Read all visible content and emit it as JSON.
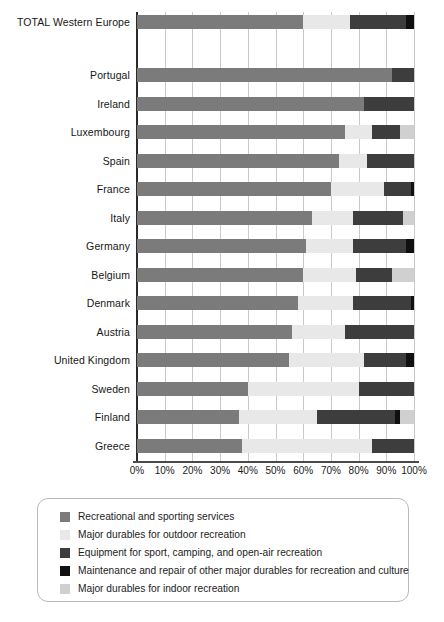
{
  "chart_data": {
    "type": "bar",
    "orientation": "horizontal",
    "stacked": true,
    "title": "",
    "subtitle": "",
    "xlabel": "",
    "ylabel": "",
    "xlim": [
      0,
      100
    ],
    "xtick_labels": [
      "0%",
      "10%",
      "20%",
      "30%",
      "40%",
      "50%",
      "60%",
      "70%",
      "80%",
      "90%",
      "100%"
    ],
    "xticks": [
      0,
      10,
      20,
      30,
      40,
      50,
      60,
      70,
      80,
      90,
      100
    ],
    "grid": true,
    "legend_position": "bottom",
    "categories": [
      "TOTAL Western Europe",
      "Portugal",
      "Ireland",
      "Luxembourg",
      "Spain",
      "France",
      "Italy",
      "Germany",
      "Belgium",
      "Denmark",
      "Austria",
      "United Kingdom",
      "Sweden",
      "Finland",
      "Greece"
    ],
    "series": [
      {
        "name": "Recreational and sporting services",
        "color": "#7b7b7b",
        "values": [
          60.0,
          92.0,
          82.0,
          75.0,
          73.0,
          70.0,
          63.0,
          61.0,
          60.0,
          58.0,
          56.0,
          55.0,
          40.0,
          37.0,
          38.0
        ]
      },
      {
        "name": "Major durables for outdoor recreation",
        "color": "#e8e8e8",
        "values": [
          17.0,
          0.0,
          0.0,
          10.0,
          10.0,
          19.0,
          15.0,
          17.0,
          19.0,
          20.0,
          19.0,
          27.0,
          40.0,
          28.0,
          47.0
        ]
      },
      {
        "name": "Equipment for sport, camping, and open-air recreation",
        "color": "#3d3d3d",
        "values": [
          20.0,
          8.0,
          18.0,
          10.0,
          17.0,
          10.0,
          18.0,
          19.0,
          13.0,
          21.0,
          25.0,
          15.0,
          20.0,
          28.0,
          15.0
        ]
      },
      {
        "name": "Maintenance and repair of other major durables for recreation and culture",
        "color": "#101010",
        "values": [
          3.0,
          0.0,
          0.0,
          0.0,
          0.0,
          1.0,
          0.0,
          3.0,
          0.0,
          1.0,
          0.0,
          3.0,
          0.0,
          2.0,
          0.0
        ]
      },
      {
        "name": "Major durables for indoor recreation",
        "color": "#d0d0d0",
        "values": [
          0.0,
          0.0,
          0.0,
          5.0,
          0.0,
          0.0,
          4.0,
          0.0,
          8.0,
          0.0,
          0.0,
          0.0,
          0.0,
          5.0,
          0.0
        ]
      }
    ]
  },
  "legend": {
    "items": [
      {
        "label": "Recreational and sporting services",
        "color": "#7b7b7b"
      },
      {
        "label": "Major durables for outdoor recreation",
        "color": "#e8e8e8"
      },
      {
        "label": "Equipment for sport, camping, and open-air recreation",
        "color": "#3d3d3d"
      },
      {
        "label": "Maintenance and repair of other major durables for recreation and culture",
        "color": "#101010"
      },
      {
        "label": "Major durables for indoor recreation",
        "color": "#d0d0d0"
      }
    ]
  }
}
